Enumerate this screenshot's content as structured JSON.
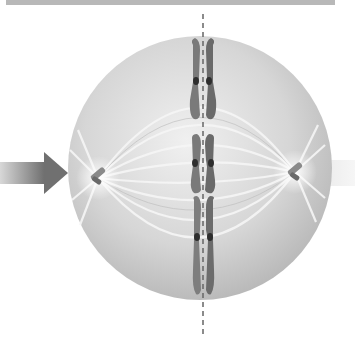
{
  "figure": {
    "colors": {
      "background": "#ffffff",
      "top_bar": "#b8b8b8",
      "cell_fill": "#cfcfcf",
      "cell_highlight": "#ececec",
      "chromosome": "#7a7a7a",
      "chromosome_dark": "#5a5a5a",
      "centromere": "#2e2e2e",
      "arrow": "#8c8c8c",
      "spindle": "#f4f4f4",
      "plate_line": "#666666"
    },
    "chromosomes": [
      {
        "id": "chromosome-1",
        "y_center": 81
      },
      {
        "id": "chromosome-2",
        "y_center": 163
      },
      {
        "id": "chromosome-3",
        "y_center": 235
      }
    ],
    "poles": [
      {
        "id": "left-centrosome",
        "x": 98,
        "y": 178
      },
      {
        "id": "right-centrosome",
        "x": 295,
        "y": 172
      }
    ]
  }
}
